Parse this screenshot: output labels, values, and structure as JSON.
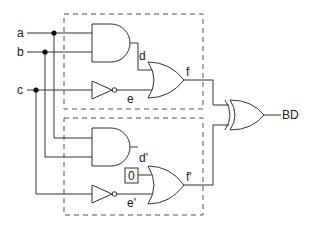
{
  "diagram": {
    "type": "logic-circuit",
    "inputs": [
      {
        "name": "a",
        "label": "a"
      },
      {
        "name": "b",
        "label": "b"
      },
      {
        "name": "c",
        "label": "c"
      }
    ],
    "signals": {
      "d": "d",
      "e": "e",
      "f": "f",
      "d_prime": "d'",
      "e_prime": "e'",
      "f_prime": "f'"
    },
    "constant": {
      "label": "0"
    },
    "output": {
      "label": "BD"
    },
    "gates": [
      {
        "id": "and-top",
        "type": "AND",
        "inputs": [
          "a",
          "b"
        ],
        "output": "d"
      },
      {
        "id": "not-top",
        "type": "NOT",
        "inputs": [
          "c"
        ],
        "output": "e"
      },
      {
        "id": "or-top",
        "type": "OR",
        "inputs": [
          "d",
          "e"
        ],
        "output": "f"
      },
      {
        "id": "and-bottom",
        "type": "AND",
        "inputs": [
          "a",
          "b"
        ],
        "output": "d'"
      },
      {
        "id": "not-bottom",
        "type": "NOT",
        "inputs": [
          "c"
        ],
        "output": "e'"
      },
      {
        "id": "or-bottom",
        "type": "OR",
        "inputs": [
          "0",
          "e'"
        ],
        "output": "f'"
      },
      {
        "id": "xor-out",
        "type": "XOR",
        "inputs": [
          "f",
          "f'"
        ],
        "output": "BD"
      }
    ],
    "colors": {
      "stroke": "#333333",
      "dash": "#555555",
      "background": "#ffffff"
    }
  }
}
